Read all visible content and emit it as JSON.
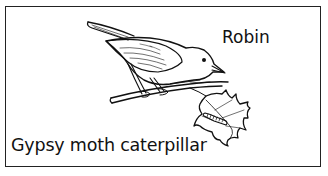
{
  "figure": {
    "type": "labeled-illustration",
    "labels": {
      "bird": "Robin",
      "insect": "Gypsy moth caterpillar"
    },
    "elements": [
      {
        "name": "robin",
        "label": "Robin",
        "description": "bird perched on a branch"
      },
      {
        "name": "branch",
        "description": "twig the robin perches on"
      },
      {
        "name": "oak-leaf",
        "description": "lobed leaf at the end of the branch"
      },
      {
        "name": "gypsy-moth-caterpillar",
        "label": "Gypsy moth caterpillar",
        "description": "caterpillar on the leaf"
      }
    ],
    "colors": {
      "line": "#111111",
      "background": "#ffffff",
      "border": "#222222"
    }
  }
}
